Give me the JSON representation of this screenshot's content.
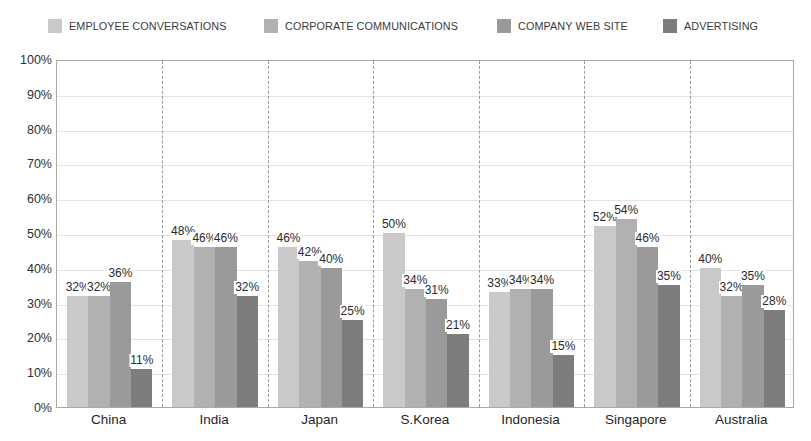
{
  "legend": {
    "position": "top-center",
    "entries": [
      {
        "label": "EMPLOYEE CONVERSATIONS",
        "color": "#c9c9c9"
      },
      {
        "label": "CORPORATE COMMUNICATIONS",
        "color": "#b1b1b1"
      },
      {
        "label": "COMPANY WEB SITE",
        "color": "#9a9a9a"
      },
      {
        "label": "ADVERTISING",
        "color": "#7d7d7d"
      }
    ]
  },
  "axis": {
    "y_ticks": [
      "100%",
      "90%",
      "80%",
      "70%",
      "60%",
      "50%",
      "40%",
      "30%",
      "20%",
      "10%",
      "0%"
    ],
    "x_categories": [
      "China",
      "India",
      "Japan",
      "S.Korea",
      "Indonesia",
      "Singapore",
      "Australia"
    ]
  },
  "chart_data": {
    "type": "bar",
    "title": "",
    "subtitle": "",
    "xlabel": "",
    "ylabel": "",
    "ylim": [
      0,
      100
    ],
    "ytick_step": 10,
    "grid": "horizontal-solid-plus-vertical-dashed-category-separators",
    "legend_position": "top-center",
    "value_suffix": "%",
    "categories": [
      "China",
      "India",
      "Japan",
      "S.Korea",
      "Indonesia",
      "Singapore",
      "Australia"
    ],
    "series": [
      {
        "name": "EMPLOYEE CONVERSATIONS",
        "color": "#c9c9c9",
        "values": [
          32,
          48,
          46,
          50,
          33,
          52,
          40
        ],
        "labels": [
          "32%",
          "48%",
          "46%",
          "50%",
          "33%",
          "52%",
          "40%"
        ]
      },
      {
        "name": "CORPORATE COMMUNICATIONS",
        "color": "#b1b1b1",
        "values": [
          32,
          46,
          42,
          34,
          34,
          54,
          32
        ],
        "labels": [
          "32%",
          "46%",
          "42%",
          "34%",
          "34%",
          "54%",
          "32%"
        ]
      },
      {
        "name": "COMPANY WEB SITE",
        "color": "#9a9a9a",
        "values": [
          36,
          46,
          40,
          31,
          34,
          46,
          35
        ],
        "labels": [
          "36%",
          "46%",
          "40%",
          "31%",
          "34%",
          "46%",
          "35%"
        ]
      },
      {
        "name": "ADVERTISING",
        "color": "#7d7d7d",
        "values": [
          11,
          32,
          25,
          21,
          15,
          35,
          28
        ],
        "labels": [
          "11%",
          "32%",
          "25%",
          "21%",
          "15%",
          "35%",
          "28%"
        ]
      }
    ]
  }
}
